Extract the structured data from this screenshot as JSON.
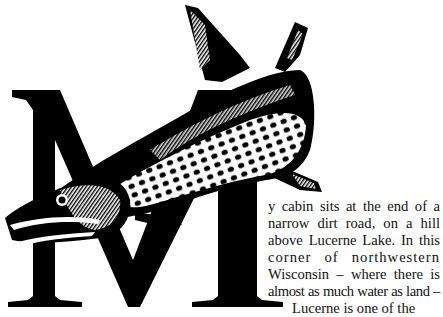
{
  "article": {
    "drop_cap": "M",
    "illustration": "muskellunge-fish-engraving",
    "lines": [
      "y cabin sits at the end of a",
      "narrow dirt road, on a hill",
      "above Lucerne Lake. In this",
      "corner of northwestern",
      "Wisconsin – where there is",
      "almost as much water as land –",
      "Lucerne is one of the"
    ],
    "paragraph": "My cabin sits at the end of a narrow dirt road, on a hill above Lucerne Lake. In this corner of northwestern Wisconsin – where there is almost as much water as land – Lucerne is one of the"
  },
  "colors": {
    "ink": "#000000",
    "paper": "#ffffff",
    "text": "#111111"
  }
}
